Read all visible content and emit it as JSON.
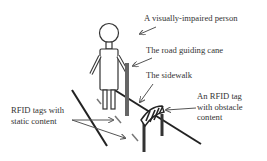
{
  "diagram": {
    "labels": {
      "person": "A visually-impaired person",
      "cane": "The road guiding cane",
      "sidewalk": "The sidewalk",
      "obstacle_tag_line1": "An RFID tag",
      "obstacle_tag_line2": "with obstacle",
      "obstacle_tag_line3": "content",
      "static_tags_line1": "RFID tags with",
      "static_tags_line2": "static content"
    },
    "colors": {
      "stroke": "#222222",
      "cane": "#555555",
      "arrow": "#555555",
      "text": "#333333",
      "background": "#ffffff"
    }
  }
}
